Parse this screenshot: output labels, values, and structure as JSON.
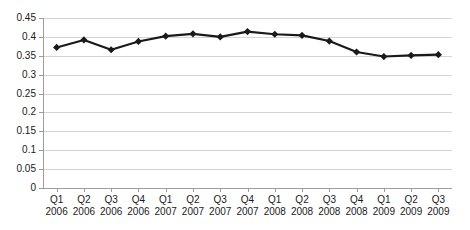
{
  "chart_data": {
    "type": "line",
    "title": "",
    "subtitle": "",
    "xlabel": "",
    "ylabel": "",
    "ylim": [
      0,
      0.45
    ],
    "grid": true,
    "legend": "none",
    "marker": "diamond",
    "line_color": "#1a1a1a",
    "marker_color": "#1a1a1a",
    "grid_color": "#d4d4d4",
    "axis_color": "#9c9c9c",
    "categories": [
      "Q1 2006",
      "Q2 2006",
      "Q3 2006",
      "Q4 2006",
      "Q1 2007",
      "Q2 2007",
      "Q3 2007",
      "Q4 2007",
      "Q1 2008",
      "Q2 2008",
      "Q3 2008",
      "Q4 2008",
      "Q1 2009",
      "Q2 2009",
      "Q3 2009"
    ],
    "quarter_labels": [
      "Q1",
      "Q2",
      "Q3",
      "Q4",
      "Q1",
      "Q2",
      "Q3",
      "Q4",
      "Q1",
      "Q2",
      "Q3",
      "Q4",
      "Q1",
      "Q2",
      "Q3"
    ],
    "year_labels": [
      "2006",
      "2006",
      "2006",
      "2006",
      "2007",
      "2007",
      "2007",
      "2007",
      "2008",
      "2008",
      "2008",
      "2008",
      "2009",
      "2009",
      "2009"
    ],
    "values": [
      0.372,
      0.392,
      0.366,
      0.388,
      0.402,
      0.408,
      0.4,
      0.414,
      0.407,
      0.404,
      0.389,
      0.36,
      0.348,
      0.351,
      0.353
    ],
    "ytick_labels": [
      "0",
      "0.05",
      "0.1",
      "0.15",
      "0.2",
      "0.25",
      "0.3",
      "0.35",
      "0.4",
      "0.45"
    ],
    "ytick_values": [
      0,
      0.05,
      0.1,
      0.15,
      0.2,
      0.25,
      0.3,
      0.35,
      0.4,
      0.45
    ]
  }
}
